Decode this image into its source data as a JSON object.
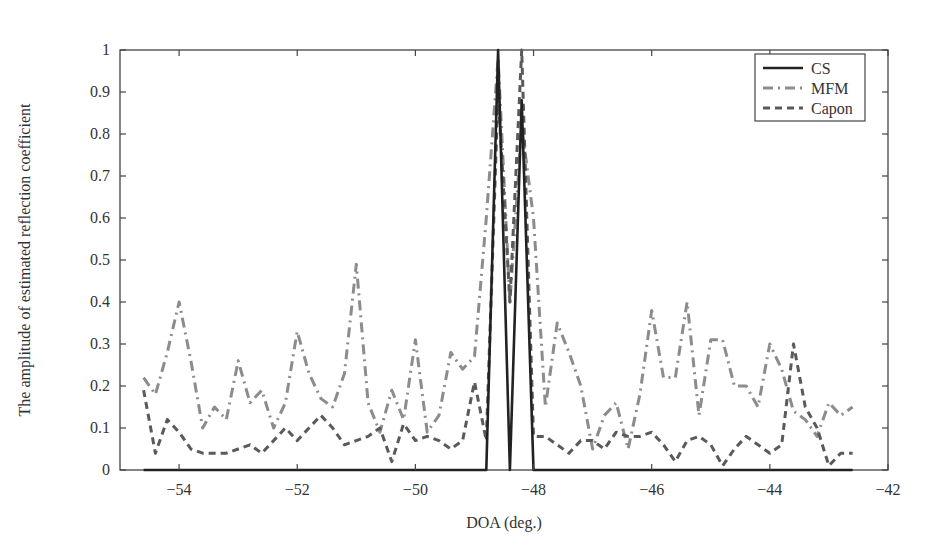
{
  "chart_data": {
    "type": "line",
    "title": "",
    "xlabel": "DOA (deg.)",
    "ylabel": "The amplitude of estimated reflection coefficient",
    "xlim": [
      -55,
      -42
    ],
    "ylim": [
      0,
      1
    ],
    "xticks": [
      -54,
      -52,
      -50,
      -48,
      -46,
      -44,
      -42
    ],
    "xtick_labels": [
      "−54",
      "−52",
      "−50",
      "−48",
      "−46",
      "−44",
      "−42"
    ],
    "yticks": [
      0,
      0.1,
      0.2,
      0.3,
      0.4,
      0.5,
      0.6,
      0.7,
      0.8,
      0.9,
      1
    ],
    "ytick_labels": [
      "0",
      "0.1",
      "0.2",
      "0.3",
      "0.4",
      "0.5",
      "0.6",
      "0.7",
      "0.8",
      "0.9",
      "1"
    ],
    "grid": false,
    "legend_position": "upper right",
    "x": [
      -54.6,
      -54.4,
      -54.2,
      -54.0,
      -53.8,
      -53.6,
      -53.4,
      -53.2,
      -53.0,
      -52.8,
      -52.6,
      -52.4,
      -52.2,
      -52.0,
      -51.8,
      -51.6,
      -51.4,
      -51.2,
      -51.0,
      -50.8,
      -50.6,
      -50.4,
      -50.2,
      -50.0,
      -49.8,
      -49.6,
      -49.4,
      -49.2,
      -49.0,
      -48.8,
      -48.6,
      -48.4,
      -48.2,
      -48.0,
      -47.8,
      -47.6,
      -47.4,
      -47.2,
      -47.0,
      -46.8,
      -46.6,
      -46.4,
      -46.2,
      -46.0,
      -45.8,
      -45.6,
      -45.4,
      -45.2,
      -45.0,
      -44.8,
      -44.6,
      -44.4,
      -44.2,
      -44.0,
      -43.8,
      -43.6,
      -43.4,
      -43.2,
      -43.0,
      -42.8,
      -42.6
    ],
    "series": [
      {
        "name": "CS",
        "style": "solid",
        "color": "#222222",
        "values": [
          0,
          0,
          0,
          0,
          0,
          0,
          0,
          0,
          0,
          0,
          0,
          0,
          0,
          0,
          0,
          0,
          0,
          0,
          0,
          0,
          0,
          0,
          0,
          0,
          0,
          0,
          0,
          0,
          0,
          0,
          1.0,
          0,
          0.88,
          0,
          0,
          0,
          0,
          0,
          0,
          0,
          0,
          0,
          0,
          0,
          0,
          0,
          0,
          0,
          0,
          0,
          0,
          0,
          0,
          0,
          0,
          0,
          0,
          0,
          0,
          0,
          0
        ]
      },
      {
        "name": "MFM",
        "style": "dash-dot",
        "color": "#8c8c8c",
        "values": [
          0.22,
          0.18,
          0.28,
          0.4,
          0.26,
          0.1,
          0.15,
          0.12,
          0.26,
          0.16,
          0.19,
          0.1,
          0.16,
          0.33,
          0.23,
          0.17,
          0.15,
          0.23,
          0.49,
          0.16,
          0.09,
          0.19,
          0.12,
          0.31,
          0.09,
          0.13,
          0.28,
          0.24,
          0.27,
          0.6,
          0.98,
          0.4,
          0.82,
          0.6,
          0.15,
          0.35,
          0.28,
          0.2,
          0.05,
          0.13,
          0.16,
          0.05,
          0.18,
          0.38,
          0.22,
          0.22,
          0.4,
          0.13,
          0.31,
          0.31,
          0.2,
          0.2,
          0.15,
          0.3,
          0.24,
          0.14,
          0.12,
          0.08,
          0.16,
          0.13,
          0.15
        ]
      },
      {
        "name": "Capon",
        "style": "dashed",
        "color": "#5a5a5a",
        "values": [
          0.19,
          0.04,
          0.12,
          0.09,
          0.05,
          0.04,
          0.04,
          0.04,
          0.05,
          0.06,
          0.04,
          0.07,
          0.1,
          0.07,
          0.1,
          0.13,
          0.1,
          0.06,
          0.07,
          0.08,
          0.1,
          0.02,
          0.11,
          0.07,
          0.08,
          0.07,
          0.05,
          0.07,
          0.21,
          0.07,
          0.9,
          0.4,
          1.0,
          0.08,
          0.08,
          0.06,
          0.04,
          0.07,
          0.07,
          0.05,
          0.09,
          0.08,
          0.08,
          0.09,
          0.06,
          0.02,
          0.07,
          0.08,
          0.06,
          0.01,
          0.05,
          0.08,
          0.06,
          0.04,
          0.06,
          0.3,
          0.15,
          0.1,
          0.01,
          0.04,
          0.04
        ]
      }
    ]
  }
}
